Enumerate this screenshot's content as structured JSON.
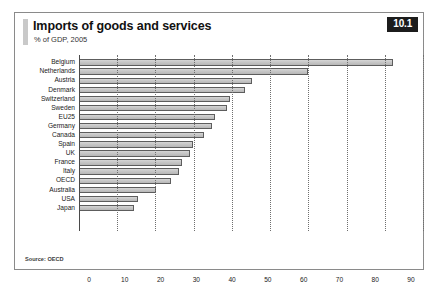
{
  "figure": {
    "badge": "10.1",
    "title": "Imports of goods and services",
    "subtitle": "% of GDP, 2005",
    "source": "Source: OECD"
  },
  "chart_data": {
    "type": "bar",
    "orientation": "horizontal",
    "title": "Imports of goods and services",
    "subtitle": "% of GDP, 2005",
    "xlabel": "",
    "ylabel": "",
    "xlim": [
      0,
      90
    ],
    "xticks": [
      0,
      10,
      20,
      30,
      40,
      50,
      60,
      70,
      80,
      90
    ],
    "grid": true,
    "legend": false,
    "categories": [
      "Belgium",
      "Netherlands",
      "Austria",
      "Denmark",
      "Switzerland",
      "Sweden",
      "EU25",
      "Germany",
      "Canada",
      "Spain",
      "UK",
      "France",
      "Italy",
      "OECD",
      "Australia",
      "USA",
      "Japan"
    ],
    "values": [
      85,
      62,
      47,
      45,
      41,
      40,
      37,
      36,
      34,
      31,
      30,
      28,
      27,
      25,
      21,
      16,
      15
    ],
    "source": "Source: OECD"
  }
}
